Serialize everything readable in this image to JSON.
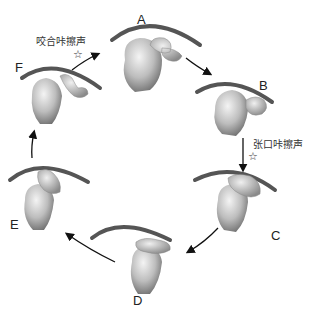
{
  "diagram": {
    "type": "cycle",
    "stages": [
      {
        "id": "A",
        "label": "A"
      },
      {
        "id": "B",
        "label": "B"
      },
      {
        "id": "C",
        "label": "C"
      },
      {
        "id": "D",
        "label": "D"
      },
      {
        "id": "E",
        "label": "E"
      },
      {
        "id": "F",
        "label": "F"
      }
    ],
    "annotations": {
      "closing_click": {
        "text": "咬合咔擦声",
        "symbol": "☆"
      },
      "opening_click": {
        "text": "张口咔擦声",
        "symbol": "☆"
      }
    },
    "arrow_color": "#111111"
  }
}
